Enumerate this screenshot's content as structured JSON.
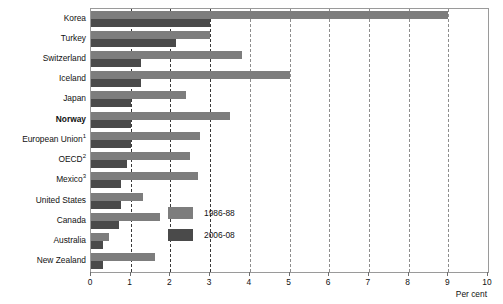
{
  "chart_data": {
    "type": "bar",
    "orientation": "horizontal",
    "title": "",
    "xlabel": "Per cent",
    "ylabel": "",
    "xlim": [
      0,
      10
    ],
    "xticks": [
      0,
      1,
      2,
      3,
      4,
      5,
      6,
      7,
      8,
      9,
      10
    ],
    "xticklabels": [
      "0",
      "1",
      "2",
      "3",
      "4",
      "5",
      "6",
      "7",
      "8",
      "9",
      "10"
    ],
    "grid": true,
    "grid_axis": "x",
    "legend_position": "inside-lower-right",
    "categories": [
      "Korea",
      "Turkey",
      "Switzerland",
      "Iceland",
      "Japan",
      "Norway",
      "European Union",
      "OECD",
      "Mexico",
      "United States",
      "Canada",
      "Australia",
      "New Zealand"
    ],
    "category_footnotes": [
      "",
      "",
      "",
      "",
      "",
      "",
      "1",
      "2",
      "3",
      "",
      "",
      "",
      ""
    ],
    "category_emphasis": [
      false,
      false,
      false,
      false,
      false,
      true,
      false,
      false,
      false,
      false,
      false,
      false,
      false
    ],
    "series": [
      {
        "name": "1986-88",
        "color": "#7d7d7d",
        "values": [
          9.0,
          3.0,
          3.8,
          5.0,
          2.4,
          3.5,
          2.75,
          2.5,
          2.7,
          1.3,
          1.75,
          0.45,
          1.6
        ]
      },
      {
        "name": "2006-08",
        "color": "#4a4a4a",
        "values": [
          3.0,
          2.15,
          1.25,
          1.25,
          1.0,
          1.0,
          1.0,
          0.9,
          0.75,
          0.75,
          0.7,
          0.3,
          0.3
        ]
      }
    ]
  },
  "legend": {
    "items": [
      {
        "label": "1986-88",
        "swatch": "light"
      },
      {
        "label": "2006-08",
        "swatch": "dark"
      }
    ]
  },
  "axis": {
    "x_title": "Per cent"
  },
  "colors": {
    "series_1986_88": "#7d7d7d",
    "series_2006_08": "#4a4a4a",
    "gridline": "#3a3a3a",
    "frame": "#9a9a9a",
    "text": "#111111"
  }
}
